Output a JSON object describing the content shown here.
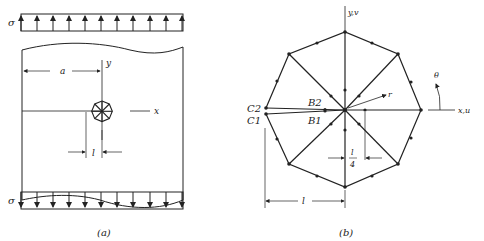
{
  "figure_a": {
    "caption": "(a)",
    "sigma_top": "σ",
    "sigma_bottom": "σ",
    "label_a": "a",
    "label_y": "y",
    "label_x": "x",
    "label_l": "l",
    "top_arrows_direction": "up",
    "bottom_arrows_direction": "down",
    "arrow_count": 11
  },
  "figure_b": {
    "caption": "(b)",
    "label_yv": "y,v",
    "label_xu": "x,u",
    "label_theta": "θ",
    "label_r": "r",
    "label_C1": "C1",
    "label_C2": "C2",
    "label_B1": "B1",
    "label_B2": "B2",
    "label_l_over_4_num": "l",
    "label_l_over_4_den": "4",
    "label_l": "l"
  },
  "colors": {
    "line": "#222222",
    "background": "#ffffff"
  }
}
